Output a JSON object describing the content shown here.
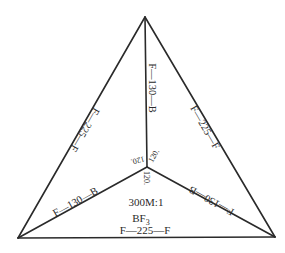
{
  "diagram": {
    "type": "molecular-geometry",
    "vertices": {
      "top": [
        145,
        17
      ],
      "bottom_left": [
        18,
        238
      ],
      "bottom_right": [
        275,
        237
      ],
      "center": [
        147,
        167
      ]
    },
    "edge_labels": {
      "left_side": "F—225—F",
      "right_side": "F—225—F",
      "bottom_side": "F—225—F",
      "bond_top": "F—130—B",
      "bond_left": "F—130—B",
      "bond_right": "F—130—B"
    },
    "angles": {
      "left": "120.",
      "right": "120.",
      "bottom": "120."
    },
    "center_labels": {
      "scale": "300M:1",
      "formula_main": "BF",
      "formula_sub": "3"
    },
    "colors": {
      "line": "#2a2a2a",
      "background": "#ffffff"
    }
  }
}
